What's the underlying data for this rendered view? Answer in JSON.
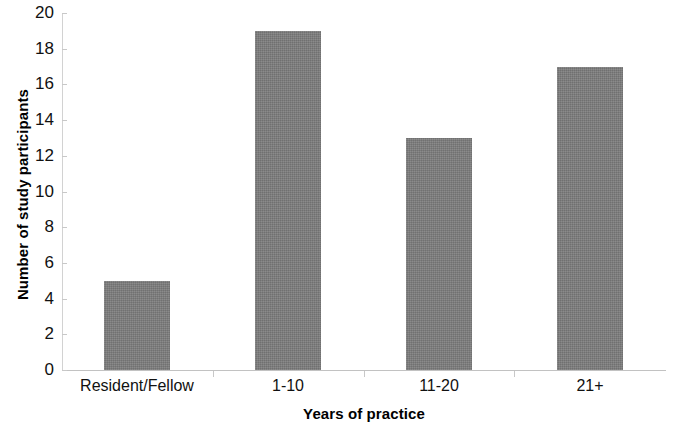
{
  "chart_data": {
    "type": "bar",
    "title": "",
    "subtitle": "",
    "categories": [
      "Resident/Fellow",
      "1-10",
      "11-20",
      "21+"
    ],
    "values": [
      5,
      19,
      13,
      17
    ],
    "xlabel": "Years of practice",
    "ylabel": "Number of study participants",
    "ylim": [
      0,
      20
    ],
    "ytick_step": 2,
    "yticks": [
      20,
      18,
      16,
      14,
      12,
      10,
      8,
      6,
      4,
      2,
      0
    ],
    "grid": false,
    "legend": null,
    "series": [
      {
        "name": "Number of study participants",
        "values": [
          5,
          19,
          13,
          17
        ]
      }
    ],
    "bar_color": "#7d7d7d",
    "background_color": "#ffffff",
    "axis_color": "#c8c8c8"
  }
}
